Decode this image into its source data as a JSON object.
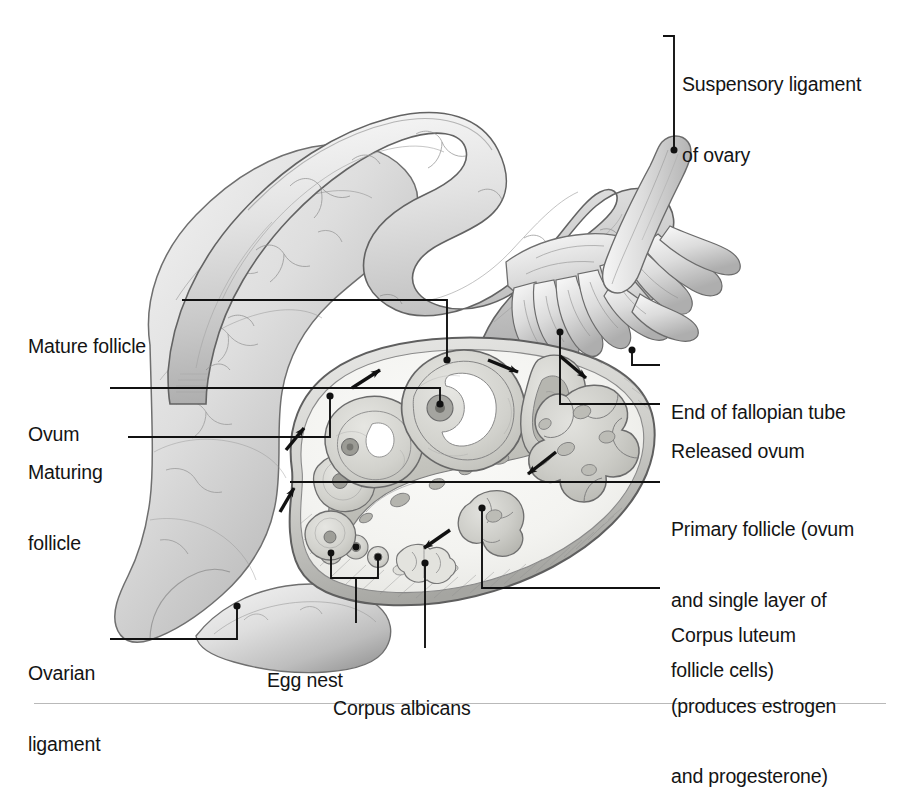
{
  "figure": {
    "type": "anatomical-illustration",
    "style": "grayscale pencil/airbrush medical illustration",
    "background": "#ffffff",
    "ink": "#141414",
    "tones": {
      "tissue_light": "#efefef",
      "tissue_mid": "#d6d6d6",
      "tissue_dark": "#a8a8a8",
      "outline": "#5a5a5a",
      "cortex_fill": "#f4f4f2",
      "medulla_fill": "#c9c9c5",
      "rule": "#b9b9b9"
    }
  },
  "labels": {
    "suspensory_ligament": {
      "lines": [
        "Suspensory ligament",
        "of ovary"
      ]
    },
    "mature_follicle": {
      "lines": [
        "Mature follicle"
      ]
    },
    "ovum": {
      "lines": [
        "Ovum"
      ]
    },
    "maturing_follicle": {
      "lines": [
        "Maturing",
        "follicle"
      ]
    },
    "ovarian_ligament": {
      "lines": [
        "Ovarian",
        "ligament"
      ]
    },
    "egg_nest": {
      "lines": [
        "Egg nest"
      ]
    },
    "corpus_albicans": {
      "lines": [
        "Corpus albicans"
      ]
    },
    "end_of_fallopian_tube": {
      "lines": [
        "End of fallopian tube"
      ]
    },
    "released_ovum": {
      "lines": [
        "Released ovum"
      ]
    },
    "primary_follicle": {
      "lines": [
        "Primary follicle (ovum",
        "and single layer of",
        "follicle cells)"
      ]
    },
    "corpus_luteum": {
      "lines": [
        "Corpus luteum",
        "(produces estrogen",
        "and progesterone)"
      ]
    }
  },
  "structures": [
    {
      "name": "fallopian-tube",
      "note": "convoluted arching tube with fine vascular markings"
    },
    {
      "name": "fimbriae",
      "note": "finger-like projections at tube end"
    },
    {
      "name": "broad-ligament",
      "note": "large sheet of tissue on left"
    },
    {
      "name": "ovarian-ligament",
      "note": "band at lower left of ovary"
    },
    {
      "name": "suspensory-ligament",
      "note": "slanted band at upper right"
    },
    {
      "name": "ovary-cross-section",
      "note": "cutaway ellipse with cortex and medulla"
    },
    {
      "name": "egg-nest",
      "note": "cluster of primordial follicles"
    },
    {
      "name": "primary-follicle",
      "note": "ovum with single layer of follicle cells"
    },
    {
      "name": "maturing-follicle",
      "note": "follicle with growing antrum"
    },
    {
      "name": "mature-follicle",
      "note": "graafian follicle with large antrum"
    },
    {
      "name": "released-ovum",
      "note": "ovum at moment of ovulation"
    },
    {
      "name": "corpus-luteum",
      "note": "lobed yellow body after ovulation"
    },
    {
      "name": "corpus-albicans",
      "note": "small scar remnant"
    },
    {
      "name": "medulla",
      "note": "inner vascular region"
    }
  ],
  "cycle_arrows": {
    "count": 6,
    "note": "arrows trace follicle development counterclockwise around the cortex"
  }
}
